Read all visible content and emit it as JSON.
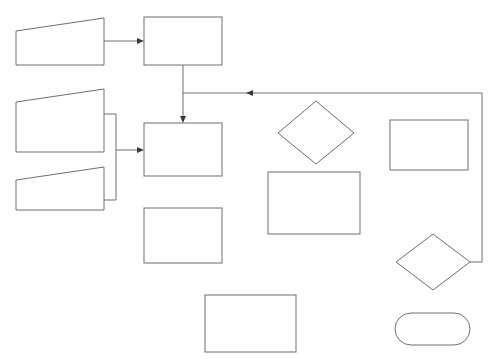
{
  "diagram": {
    "type": "flowchart",
    "inputs": [
      {
        "id": "in1",
        "label": "Maximum antenna input power to meet EMR requirements"
      },
      {
        "id": "in2",
        "label": "Building drawings with identified coverage requirements"
      },
      {
        "id": "in3",
        "label": "Preferred and forbidden antenna locations"
      }
    ],
    "processes": [
      {
        "id": "p1",
        "label": "Estimate maximum path loss from Link Budget"
      },
      {
        "id": "p2",
        "label": "Estimate antenna location and cable routing"
      },
      {
        "id": "p3",
        "label": "Determine antenna system loss to each antenna"
      },
      {
        "id": "p4",
        "label": "Estimate maximum allowable propagation loss from Link Budget and calculated antenna system loss"
      },
      {
        "id": "p5",
        "label": "Estimate coverage range using the selected RF propagation model"
      },
      {
        "id": "p6",
        "label": "Estimate geometry based on outdoor site location and statistical BPL"
      }
    ],
    "decisions": [
      {
        "id": "d1",
        "label": "Are all coverage requirements fulfilled?"
      },
      {
        "id": "d2",
        "label": "Is geometry requirement fulfilled?"
      }
    ],
    "terminals": [
      {
        "id": "t1",
        "label": "Proceed toward implementation"
      }
    ],
    "edge_labels": {
      "d1_no": "No",
      "d1_yes": "yes",
      "d2_no": "No",
      "d2_yes": "Yes"
    },
    "edges": [
      {
        "from": "in1",
        "to": "p1"
      },
      {
        "from": "in2",
        "to": "p2"
      },
      {
        "from": "in3",
        "to": "p2"
      },
      {
        "from": "p1",
        "to": "p2"
      },
      {
        "from": "p2",
        "to": "p3"
      },
      {
        "from": "p3",
        "to": "p4"
      },
      {
        "from": "p4",
        "to": "p5"
      },
      {
        "from": "p5",
        "to": "d1"
      },
      {
        "from": "d1",
        "to": "p2",
        "label": "No"
      },
      {
        "from": "d1",
        "to": "p6",
        "label": "yes"
      },
      {
        "from": "p6",
        "to": "d2"
      },
      {
        "from": "d2",
        "to": "p2",
        "label": "No"
      },
      {
        "from": "d2",
        "to": "t1",
        "label": "Yes"
      }
    ]
  }
}
